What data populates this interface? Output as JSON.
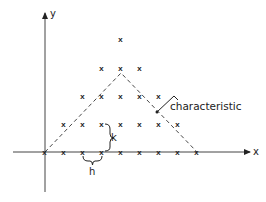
{
  "diagram": {
    "title": "",
    "axes": {
      "x_label": "x",
      "y_label": "y"
    },
    "grid_marker": "x",
    "spacing_labels": {
      "horizontal": "h",
      "vertical": "k"
    },
    "annotation": {
      "text": "characteristic"
    },
    "rows": [
      {
        "level": 0,
        "count": 9
      },
      {
        "level": 1,
        "count": 7
      },
      {
        "level": 2,
        "count": 5
      },
      {
        "level": 3,
        "count": 3
      },
      {
        "level": 4,
        "count": 1
      }
    ],
    "colors": {
      "ink": "#222222",
      "background": "#ffffff"
    }
  }
}
